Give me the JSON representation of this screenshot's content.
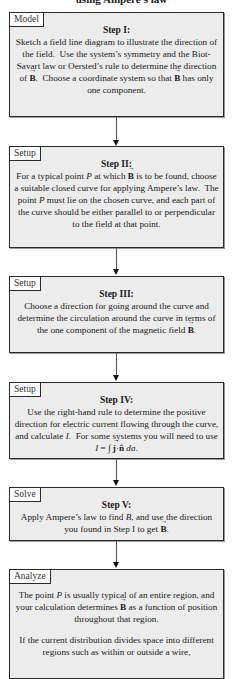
{
  "diagram": {
    "title": "using Ampere's law",
    "steps": [
      {
        "tag": "Model",
        "heading": "Step I:",
        "text": "Sketch a field line diagram to illustrate the direction of the field. Use the system's symmetry and the Biot-Savart law or Oersted's rule to determine the direction of B. Choose a coordinate system so that B has only one component."
      },
      {
        "tag": "Setup",
        "heading": "Step II:",
        "text": "For a typical point P at which B is to be found, choose a suitable closed curve for applying Ampere's law. The point P must lie on the chosen curve, and each part of the curve should be either parallel to or perpendicular to the field at that point."
      },
      {
        "tag": "Setup",
        "heading": "Step III:",
        "text": "Choose a direction for going around the curve and determine the circulation around the curve in terms of the one component of the magnetic field B."
      },
      {
        "tag": "Setup",
        "heading": "Step IV:",
        "text": "Use the right-hand rule to determine the positive direction for electric current flowing through the curve, and calculate I. For some systems you will need to use I = ∫ j·n̂ da."
      },
      {
        "tag": "Solve",
        "heading": "Step V:",
        "text": "Apply Ampere's law to find B, and use the direction you found in Step I to get B."
      },
      {
        "tag": "Analyze",
        "heading": "",
        "text": "The point P is usually typical of an entire region, and your calculation determines B as a function of position throughout that region.",
        "text2": "If the current distribution divides space into different regions such as within or outside a wire,"
      }
    ],
    "colors": {
      "box_fill": "#ececec",
      "border": "#2a2a2a",
      "tag_fill": "#ffffff"
    }
  }
}
